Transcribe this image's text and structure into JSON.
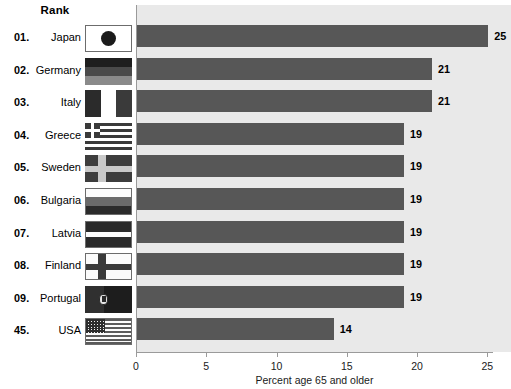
{
  "table": {
    "rank_header": "Rank",
    "rows": [
      {
        "rank": "01.",
        "country": "Japan",
        "flag": "japan-flag",
        "value": 25,
        "value_label": "25"
      },
      {
        "rank": "02.",
        "country": "Germany",
        "flag": "germany-flag",
        "value": 21,
        "value_label": "21"
      },
      {
        "rank": "03.",
        "country": "Italy",
        "flag": "italy-flag",
        "value": 21,
        "value_label": "21"
      },
      {
        "rank": "04.",
        "country": "Greece",
        "flag": "greece-flag",
        "value": 19,
        "value_label": "19"
      },
      {
        "rank": "05.",
        "country": "Sweden",
        "flag": "sweden-flag",
        "value": 19,
        "value_label": "19"
      },
      {
        "rank": "06.",
        "country": "Bulgaria",
        "flag": "bulgaria-flag",
        "value": 19,
        "value_label": "19"
      },
      {
        "rank": "07.",
        "country": "Latvia",
        "flag": "latvia-flag",
        "value": 19,
        "value_label": "19"
      },
      {
        "rank": "08.",
        "country": "Finland",
        "flag": "finland-flag",
        "value": 19,
        "value_label": "19"
      },
      {
        "rank": "09.",
        "country": "Portugal",
        "flag": "portugal-flag",
        "value": 19,
        "value_label": "19"
      },
      {
        "rank": "45.",
        "country": "USA",
        "flag": "usa-flag",
        "value": 14,
        "value_label": "14"
      }
    ]
  },
  "axis": {
    "title": "Percent age 65 and older",
    "ticks": [
      "0",
      "5",
      "10",
      "15",
      "20",
      "25"
    ],
    "tick_values": [
      0,
      5,
      10,
      15,
      20,
      25
    ]
  },
  "colors": {
    "bar": "#575757",
    "plot_background": "#e9e9e9",
    "axis": "#9a9a9a",
    "text": "#000000"
  },
  "chart_data": {
    "type": "bar",
    "orientation": "horizontal",
    "title": "",
    "subtitle": "",
    "xlabel": "Percent age 65 and older",
    "ylabel": "",
    "categories": [
      "Japan",
      "Germany",
      "Italy",
      "Greece",
      "Sweden",
      "Bulgaria",
      "Latvia",
      "Finland",
      "Portugal",
      "USA"
    ],
    "values": [
      25,
      21,
      21,
      19,
      19,
      19,
      19,
      19,
      19,
      14
    ],
    "data_labels": [
      "25",
      "21",
      "21",
      "19",
      "19",
      "19",
      "19",
      "19",
      "19",
      "14"
    ],
    "ranks": [
      "01.",
      "02.",
      "03.",
      "04.",
      "05.",
      "06.",
      "07.",
      "08.",
      "09.",
      "45."
    ],
    "xlim": [
      0,
      26.5
    ],
    "xticks": [
      0,
      5,
      10,
      15,
      20,
      25
    ],
    "xticklabels": [
      "0",
      "5",
      "10",
      "15",
      "20",
      "25"
    ],
    "grid": false,
    "legend": null,
    "bar_color": "#575757",
    "plot_background": "#e9e9e9"
  }
}
